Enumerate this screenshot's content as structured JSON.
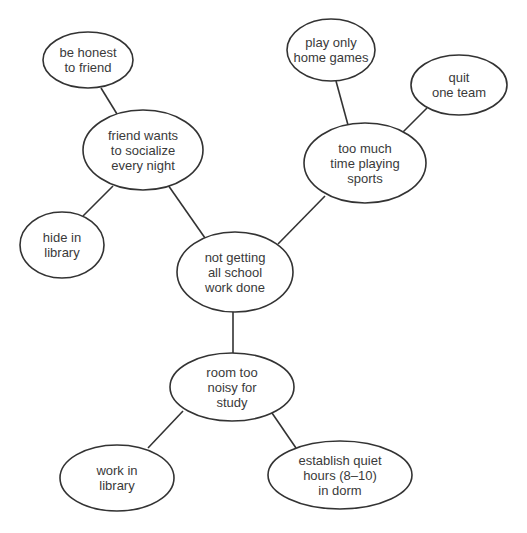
{
  "diagram": {
    "type": "mind-map",
    "colors": {
      "stroke": "#333333",
      "text": "#3a3a3a",
      "background": "#ffffff"
    },
    "nodes": [
      {
        "id": "center",
        "label": "not getting\nall school\nwork done",
        "cx": 235,
        "cy": 272,
        "rx": 58,
        "ry": 40
      },
      {
        "id": "friend",
        "label": "friend wants\nto socialize\nevery night",
        "cx": 143,
        "cy": 150,
        "rx": 60,
        "ry": 40
      },
      {
        "id": "honest",
        "label": "be honest\nto friend",
        "cx": 88,
        "cy": 60,
        "rx": 45,
        "ry": 28
      },
      {
        "id": "hide",
        "label": "hide in\nlibrary",
        "cx": 62,
        "cy": 245,
        "rx": 42,
        "ry": 33
      },
      {
        "id": "sports",
        "label": "too much\ntime playing\nsports",
        "cx": 365,
        "cy": 163,
        "rx": 61,
        "ry": 40
      },
      {
        "id": "home",
        "label": "play only\nhome games",
        "cx": 331,
        "cy": 50,
        "rx": 44,
        "ry": 31
      },
      {
        "id": "quit",
        "label": "quit\none team",
        "cx": 459,
        "cy": 85,
        "rx": 48,
        "ry": 30
      },
      {
        "id": "noisy",
        "label": "room too\nnoisy for\nstudy",
        "cx": 232,
        "cy": 387,
        "rx": 62,
        "ry": 34
      },
      {
        "id": "worklib",
        "label": "work in\nlibrary",
        "cx": 117,
        "cy": 478,
        "rx": 57,
        "ry": 33
      },
      {
        "id": "quiet",
        "label": "establish quiet\nhours (8–10)\nin dorm",
        "cx": 340,
        "cy": 475,
        "rx": 72,
        "ry": 34
      }
    ],
    "edges": [
      {
        "from": "center",
        "to": "friend",
        "x1": 205,
        "y1": 238,
        "x2": 168,
        "y2": 185
      },
      {
        "from": "friend",
        "to": "honest",
        "x1": 117,
        "y1": 114,
        "x2": 101,
        "y2": 88
      },
      {
        "from": "friend",
        "to": "hide",
        "x1": 113,
        "y1": 186,
        "x2": 83,
        "y2": 216
      },
      {
        "from": "center",
        "to": "sports",
        "x1": 278,
        "y1": 244,
        "x2": 325,
        "y2": 196
      },
      {
        "from": "sports",
        "to": "home",
        "x1": 348,
        "y1": 125,
        "x2": 336,
        "y2": 81
      },
      {
        "from": "sports",
        "to": "quit",
        "x1": 403,
        "y1": 132,
        "x2": 427,
        "y2": 108
      },
      {
        "from": "center",
        "to": "noisy",
        "x1": 233,
        "y1": 312,
        "x2": 233,
        "y2": 353
      },
      {
        "from": "noisy",
        "to": "worklib",
        "x1": 183,
        "y1": 411,
        "x2": 148,
        "y2": 448
      },
      {
        "from": "noisy",
        "to": "quiet",
        "x1": 272,
        "y1": 413,
        "x2": 296,
        "y2": 448
      }
    ]
  }
}
